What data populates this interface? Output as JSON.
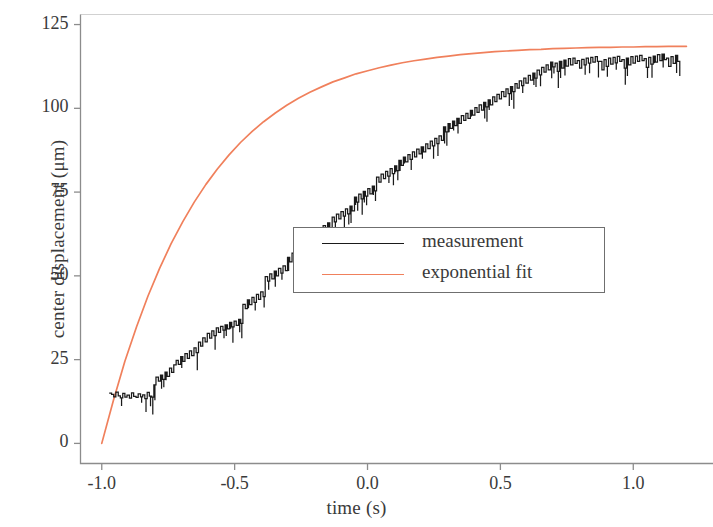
{
  "chart_data": {
    "type": "line",
    "title": "",
    "xlabel": "time (s)",
    "ylabel": "center displacement (μm)",
    "xlim": [
      -1.08,
      1.3
    ],
    "ylim": [
      -6,
      128
    ],
    "xticks": [
      -1.0,
      -0.5,
      0.0,
      0.5,
      1.0
    ],
    "xticklabels": [
      "-1.0",
      "-0.5",
      "0.0",
      "0.5",
      "1.0"
    ],
    "yticks": [
      0,
      25,
      50,
      75,
      100,
      125
    ],
    "yticklabels": [
      "0",
      "25",
      "50",
      "75",
      "100",
      "125"
    ],
    "grid": false,
    "legend_position": "center",
    "colors": {
      "measurement": "#1a1a1a",
      "exponential_fit": "#f0805c",
      "axis": "#8c8c8c",
      "text": "#3a3a3a",
      "background": "#ffffff"
    },
    "series": [
      {
        "name": "measurement",
        "color": "#1a1a1a",
        "style": "noisy-step",
        "x": [
          -0.972,
          -0.963,
          -0.955,
          -0.947,
          -0.938,
          -0.93,
          -0.921,
          -0.913,
          -0.905,
          -0.896,
          -0.888,
          -0.88,
          -0.871,
          -0.863,
          -0.854,
          -0.846,
          -0.838,
          -0.829,
          -0.821,
          -0.812,
          -0.804,
          -0.796,
          -0.787,
          -0.779,
          -0.771,
          -0.762,
          -0.754,
          -0.745,
          -0.737,
          -0.729,
          -0.72,
          -0.712,
          -0.703,
          -0.695,
          -0.687,
          -0.678,
          -0.67,
          -0.662,
          -0.653,
          -0.645,
          -0.636,
          -0.628,
          -0.62,
          -0.611,
          -0.603,
          -0.594,
          -0.586,
          -0.578,
          -0.569,
          -0.561,
          -0.553,
          -0.544,
          -0.536,
          -0.527,
          -0.519,
          -0.511,
          -0.502,
          -0.494,
          -0.485,
          -0.477,
          -0.469,
          -0.46,
          -0.452,
          -0.444,
          -0.435,
          -0.427,
          -0.418,
          -0.41,
          -0.402,
          -0.393,
          -0.385,
          -0.376,
          -0.368,
          -0.36,
          -0.351,
          -0.343,
          -0.335,
          -0.326,
          -0.318,
          -0.309,
          -0.301,
          -0.293,
          -0.284,
          -0.276,
          -0.267,
          -0.259,
          -0.251,
          -0.242,
          -0.234,
          -0.226,
          -0.217,
          -0.209,
          -0.2,
          -0.192,
          -0.184,
          -0.175,
          -0.167,
          -0.158,
          -0.15,
          -0.142,
          -0.133,
          -0.125,
          -0.117,
          -0.108,
          -0.1,
          -0.091,
          -0.083,
          -0.075,
          -0.066,
          -0.058,
          -0.049,
          -0.041,
          -0.033,
          -0.024,
          -0.016,
          -0.008,
          0.001,
          0.009,
          0.018,
          0.026,
          0.034,
          0.043,
          0.051,
          0.06,
          0.068,
          0.076,
          0.085,
          0.093,
          0.102,
          0.11,
          0.118,
          0.127,
          0.135,
          0.143,
          0.152,
          0.16,
          0.169,
          0.177,
          0.185,
          0.194,
          0.202,
          0.211,
          0.219,
          0.227,
          0.236,
          0.244,
          0.253,
          0.261,
          0.269,
          0.278,
          0.286,
          0.294,
          0.303,
          0.311,
          0.32,
          0.328,
          0.336,
          0.345,
          0.353,
          0.362,
          0.37,
          0.378,
          0.387,
          0.395,
          0.404,
          0.412,
          0.42,
          0.429,
          0.437,
          0.445,
          0.454,
          0.462,
          0.471,
          0.479,
          0.487,
          0.496,
          0.504,
          0.513,
          0.521,
          0.529,
          0.538,
          0.546,
          0.555,
          0.563,
          0.571,
          0.58,
          0.588,
          0.596,
          0.605,
          0.613,
          0.622,
          0.63,
          0.638,
          0.647,
          0.655,
          0.664,
          0.672,
          0.68,
          0.689,
          0.697,
          0.706,
          0.714,
          0.722,
          0.731,
          0.739,
          0.747,
          0.756,
          0.764,
          0.773,
          0.781,
          0.789,
          0.798,
          0.806,
          0.815,
          0.823,
          0.831,
          0.84,
          0.848,
          0.857,
          0.865,
          0.873,
          0.882,
          0.89,
          0.898,
          0.907,
          0.915,
          0.924,
          0.932,
          0.94,
          0.949,
          0.957,
          0.966,
          0.974,
          0.982,
          0.991,
          0.999,
          1.008,
          1.016,
          1.024,
          1.033,
          1.041,
          1.049,
          1.058,
          1.066,
          1.075,
          1.083,
          1.091,
          1.1,
          1.108,
          1.117,
          1.125,
          1.133,
          1.142,
          1.15,
          1.159,
          1.167,
          1.175
        ],
        "y": [
          15.0,
          14.6,
          13.9,
          15.3,
          14.2,
          13.6,
          14.9,
          13.8,
          14.4,
          13.5,
          15.1,
          14.0,
          13.7,
          14.8,
          13.9,
          14.5,
          13.4,
          15.2,
          14.1,
          13.8,
          17.5,
          19.8,
          18.6,
          20.4,
          19.1,
          21.3,
          20.0,
          22.5,
          21.2,
          23.4,
          24.8,
          23.6,
          25.9,
          24.5,
          26.8,
          25.4,
          27.6,
          26.2,
          28.5,
          27.1,
          30.2,
          29.0,
          31.5,
          30.3,
          32.8,
          31.4,
          33.6,
          32.2,
          34.5,
          33.1,
          34.9,
          33.8,
          35.4,
          34.2,
          36.1,
          34.8,
          36.5,
          35.2,
          37.0,
          35.8,
          41.5,
          40.2,
          42.8,
          41.4,
          43.6,
          42.1,
          44.5,
          43.0,
          45.2,
          43.8,
          49.8,
          48.4,
          50.6,
          49.1,
          51.4,
          50.0,
          52.2,
          50.8,
          53.0,
          51.6,
          55.5,
          54.2,
          56.8,
          55.4,
          57.6,
          56.1,
          58.4,
          57.0,
          59.2,
          57.8,
          62.5,
          61.0,
          63.4,
          62.0,
          64.2,
          62.8,
          65.0,
          63.5,
          65.8,
          64.4,
          67.5,
          66.1,
          68.4,
          67.0,
          69.2,
          67.8,
          70.0,
          68.5,
          70.8,
          69.4,
          73.5,
          72.0,
          74.4,
          73.0,
          75.2,
          73.8,
          76.0,
          74.5,
          76.8,
          75.4,
          79.5,
          78.0,
          80.4,
          79.0,
          81.2,
          79.8,
          82.0,
          80.5,
          82.8,
          81.4,
          84.5,
          83.0,
          85.4,
          84.0,
          86.2,
          84.8,
          87.0,
          85.5,
          87.8,
          86.4,
          88.5,
          87.0,
          89.4,
          88.0,
          90.2,
          88.8,
          91.0,
          89.5,
          91.8,
          90.4,
          94.5,
          93.0,
          95.4,
          94.0,
          96.2,
          94.8,
          97.0,
          95.5,
          97.8,
          96.4,
          98.5,
          97.0,
          99.4,
          98.0,
          100.2,
          98.8,
          101.0,
          99.5,
          101.8,
          100.4,
          102.5,
          101.0,
          103.4,
          102.0,
          104.2,
          102.8,
          105.0,
          103.5,
          105.8,
          104.4,
          106.5,
          105.0,
          107.4,
          106.0,
          108.2,
          106.8,
          109.0,
          107.5,
          109.8,
          108.4,
          110.5,
          109.0,
          111.4,
          110.0,
          112.2,
          110.8,
          113.0,
          111.5,
          113.8,
          112.4,
          113.5,
          111.0,
          114.0,
          112.0,
          114.4,
          112.6,
          114.8,
          113.0,
          115.0,
          113.4,
          114.2,
          112.0,
          114.6,
          113.0,
          115.0,
          113.5,
          115.2,
          113.8,
          115.4,
          114.0,
          114.0,
          111.5,
          114.5,
          112.5,
          115.0,
          113.2,
          115.2,
          113.6,
          115.5,
          114.0,
          114.5,
          112.0,
          115.0,
          113.0,
          115.4,
          113.5,
          115.6,
          114.0,
          115.8,
          114.2,
          114.8,
          112.2,
          115.2,
          113.2,
          115.6,
          113.8,
          116.0,
          114.2,
          116.2,
          114.5,
          115.0,
          112.5,
          115.4,
          113.4,
          115.8,
          114.0,
          114.2
        ]
      },
      {
        "name": "exponential fit",
        "color": "#f0805c",
        "style": "smooth",
        "model": "A*(1-exp(-(t-t0)/tau))",
        "params": {
          "A": 118.0,
          "t0": -1.0,
          "tau": 0.38,
          "asymptote": 118.0
        },
        "x": [
          -1.0,
          -0.956,
          -0.913,
          -0.869,
          -0.826,
          -0.782,
          -0.739,
          -0.695,
          -0.652,
          -0.608,
          -0.565,
          -0.521,
          -0.478,
          -0.434,
          -0.391,
          -0.347,
          -0.304,
          -0.26,
          -0.217,
          -0.173,
          -0.13,
          -0.086,
          -0.043,
          0.001,
          0.044,
          0.088,
          0.131,
          0.175,
          0.218,
          0.262,
          0.305,
          0.349,
          0.392,
          0.436,
          0.479,
          0.523,
          0.566,
          0.61,
          0.653,
          0.697,
          0.74,
          0.784,
          0.827,
          0.871,
          0.914,
          0.958,
          1.001,
          1.045,
          1.088,
          1.132,
          1.175,
          1.2
        ],
        "y": [
          0.0,
          12.9,
          24.5,
          34.8,
          44.0,
          52.3,
          59.6,
          66.2,
          72.0,
          77.3,
          81.9,
          86.1,
          89.8,
          93.1,
          96.0,
          98.6,
          100.9,
          103.0,
          104.8,
          106.4,
          107.9,
          109.1,
          110.3,
          111.2,
          112.1,
          112.9,
          113.6,
          114.2,
          114.7,
          115.2,
          115.6,
          116.0,
          116.3,
          116.6,
          116.9,
          117.1,
          117.3,
          117.5,
          117.6,
          117.8,
          117.9,
          118.0,
          118.1,
          118.2,
          118.2,
          118.3,
          118.3,
          118.4,
          118.4,
          118.5,
          118.5,
          118.5
        ]
      }
    ],
    "legend_entries": [
      {
        "label": "measurement",
        "color": "#1a1a1a"
      },
      {
        "label": "exponential fit",
        "color": "#f0805c"
      }
    ]
  }
}
